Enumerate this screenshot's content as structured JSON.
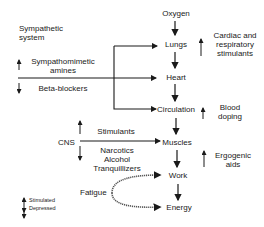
{
  "chain": {
    "oxygen": "Oxygen",
    "lungs": "Lungs",
    "heart": "Heart",
    "circulation": "Circulation",
    "muscles": "Muscles",
    "work": "Work",
    "energy": "Energy"
  },
  "left": {
    "sympathetic_system": [
      "Sympathetic",
      "system"
    ],
    "sympathomimetic": [
      "Sympathomimetic",
      "amines"
    ],
    "beta_blockers": "Beta-blockers",
    "cns": "CNS",
    "stimulants": "Stimulants",
    "depressants": [
      "Narcotics",
      "Alcohol",
      "Tranquillizers"
    ],
    "fatigue": "Fatigue"
  },
  "right": {
    "cardiac": [
      "Cardiac and",
      "respiratory",
      "stimulants"
    ],
    "blood_doping": [
      "Blood",
      "doping"
    ],
    "ergogenic": [
      "Ergogenic",
      "aids"
    ]
  },
  "legend": {
    "stimulated": "Stimulated",
    "depressed": "Depressed"
  }
}
